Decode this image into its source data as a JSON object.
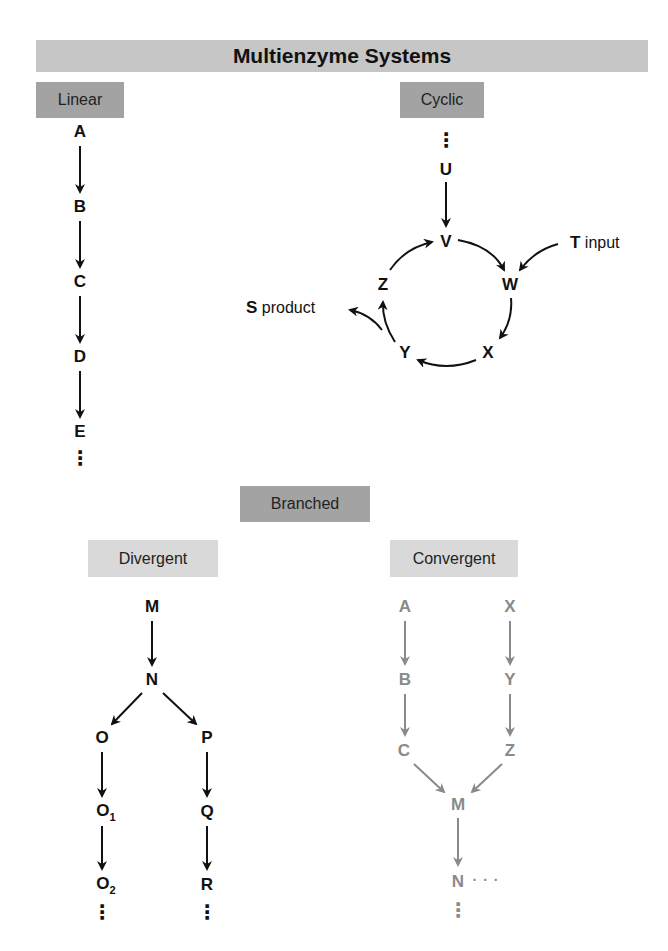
{
  "title": "Multienzyme Systems",
  "colors": {
    "banner": "#c6c6c6",
    "label_dark": "#a3a3a3",
    "label_light": "#d9d9d9",
    "black": "#111111",
    "gray_pathway": "#8a8a8a"
  },
  "sections": {
    "linear": {
      "label": "Linear",
      "nodes": [
        "A",
        "B",
        "C",
        "D",
        "E"
      ],
      "continuation": "⋮"
    },
    "cyclic": {
      "label": "Cyclic",
      "entry_continuation": "⋮",
      "entry_node": "U",
      "ring_nodes": [
        "V",
        "W",
        "X",
        "Y",
        "Z"
      ],
      "input": {
        "symbol": "T",
        "text": "input"
      },
      "product": {
        "symbol": "S",
        "text": "product"
      }
    },
    "branched": {
      "label": "Branched",
      "divergent": {
        "label": "Divergent",
        "nodes": {
          "m": "M",
          "n": "N",
          "o": "O",
          "o1_base": "O",
          "o1_sub": "1",
          "o2_base": "O",
          "o2_sub": "2",
          "p": "P",
          "q": "Q",
          "r": "R"
        },
        "continuation": "⋮"
      },
      "convergent": {
        "label": "Convergent",
        "nodes": {
          "a": "A",
          "b": "B",
          "c": "C",
          "x": "X",
          "y": "Y",
          "z": "Z",
          "m": "M",
          "n": "N"
        },
        "continuation_right": "· · ·",
        "continuation_down": "⋮"
      }
    }
  }
}
